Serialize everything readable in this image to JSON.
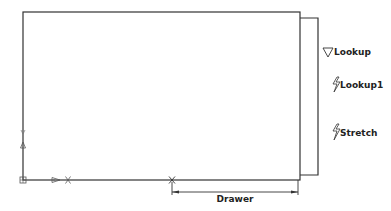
{
  "drawing": {
    "type": "cad-dynamic-block",
    "colors": {
      "background": "#ffffff",
      "line": "#333333",
      "text": "#222222",
      "grip": "#555555"
    },
    "main_rectangle": {
      "x": 23,
      "y": 12,
      "width": 277,
      "height": 168
    },
    "drawer_panel": {
      "x": 300,
      "y": 18,
      "width": 18,
      "height": 157
    },
    "labels": {
      "lookup": "Lookup",
      "lookup1": "Lookup1",
      "stretch": "Stretch"
    },
    "dimension": {
      "label": "Drawer",
      "x1": 172,
      "x2": 298,
      "y": 192
    },
    "icons": {
      "lookup_icon": "lookup-triangle-icon",
      "lookup1_icon": "action-lightning-icon",
      "stretch_icon": "action-lightning-icon",
      "ucs_icon": "ucs-origin-icon",
      "x_marker": "x-grip-marker",
      "param_arrow": "parameter-arrow-grip"
    }
  }
}
